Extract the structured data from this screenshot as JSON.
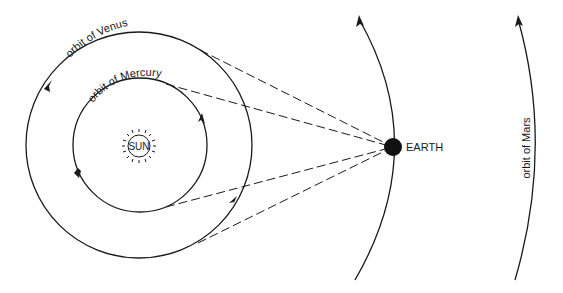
{
  "diagram": {
    "labels": {
      "venus_orbit": "orbit of Venus",
      "mercury_orbit": "orbit of Mercury",
      "sun": "SUN",
      "earth": "EARTH",
      "mars_orbit": "orbit of Mars"
    },
    "bodies": [
      {
        "name": "Sun",
        "label": "SUN"
      },
      {
        "name": "Earth",
        "label": "EARTH"
      }
    ],
    "orbits": [
      {
        "name": "Mercury",
        "label": "orbit of Mercury",
        "direction": "counter-clockwise"
      },
      {
        "name": "Venus",
        "label": "orbit of Venus",
        "direction": "counter-clockwise"
      },
      {
        "name": "Earth",
        "label": "",
        "direction": "upward"
      },
      {
        "name": "Mars",
        "label": "orbit of Mars",
        "direction": "upward"
      }
    ],
    "sight_lines": [
      {
        "from": "Earth",
        "to": "Venus orbit (upper tangent)"
      },
      {
        "from": "Earth",
        "to": "Mercury orbit (upper tangent)"
      },
      {
        "from": "Earth",
        "to": "Mercury orbit (lower tangent)"
      },
      {
        "from": "Earth",
        "to": "Venus orbit (lower tangent)"
      }
    ],
    "colors": {
      "ink": "#1a1a1a",
      "background": "#ffffff"
    }
  }
}
